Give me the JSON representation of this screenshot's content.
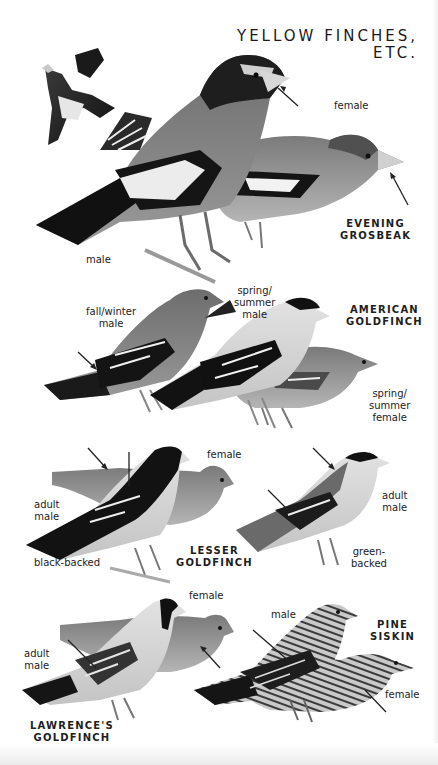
{
  "page": {
    "title_line1": "YELLOW FINCHES,",
    "title_line2": "ETC."
  },
  "species": [
    {
      "id": "evening-grosbeak",
      "name_line1": "EVENING",
      "name_line2": "GROSBEAK"
    },
    {
      "id": "american-goldfinch",
      "name_line1": "AMERICAN",
      "name_line2": "GOLDFINCH"
    },
    {
      "id": "lesser-goldfinch",
      "name_line1": "LESSER",
      "name_line2": "GOLDFINCH"
    },
    {
      "id": "lawrences-goldfinch",
      "name_line1": "LAWRENCE'S",
      "name_line2": "GOLDFINCH"
    },
    {
      "id": "pine-siskin",
      "name_line1": "PINE",
      "name_line2": "SISKIN"
    }
  ],
  "labels": {
    "evening_grosbeak": {
      "female": "female",
      "male": "male"
    },
    "american_goldfinch": {
      "fall_winter_male_1": "fall/winter",
      "fall_winter_male_2": "male",
      "spring_summer_male_1": "spring/",
      "spring_summer_male_2": "summer",
      "spring_summer_male_3": "male",
      "spring_summer_female_1": "spring/",
      "spring_summer_female_2": "summer",
      "spring_summer_female_3": "female"
    },
    "lesser_goldfinch": {
      "female": "female",
      "adult_male_1": "adult",
      "adult_male_2": "male",
      "black_backed": "black-backed",
      "adult_male_right_1": "adult",
      "adult_male_right_2": "male",
      "green_backed_1": "green-",
      "green_backed_2": "backed"
    },
    "lawrences_goldfinch": {
      "female": "female",
      "adult_male_1": "adult",
      "adult_male_2": "male"
    },
    "pine_siskin": {
      "male": "male",
      "female": "female"
    }
  },
  "colors": {
    "background": "#ffffff",
    "text": "#222222",
    "ink_dark": "#1a1a1a",
    "mid_gray": "#8a8a8a",
    "light_gray": "#c8c8c8"
  }
}
